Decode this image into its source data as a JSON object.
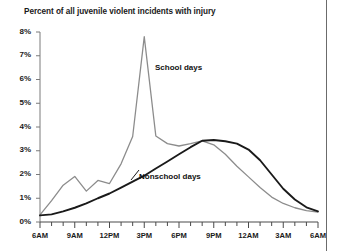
{
  "chart_data": {
    "type": "line",
    "title": "Percent of all juvenile violent incidents with injury",
    "xlabel": "",
    "ylabel": "",
    "grid": false,
    "legend_position": "inline-annotation",
    "ylim": [
      0,
      8
    ],
    "yticks": [
      0,
      1,
      2,
      3,
      4,
      5,
      6,
      7,
      8
    ],
    "ytick_labels": [
      "0%",
      "1%",
      "2%",
      "3%",
      "4%",
      "5%",
      "6%",
      "7%",
      "8%"
    ],
    "x": [
      "6AM",
      "7AM",
      "8AM",
      "9AM",
      "10AM",
      "11AM",
      "12PM",
      "1PM",
      "2PM",
      "3PM",
      "4PM",
      "5PM",
      "6PM",
      "7PM",
      "8PM",
      "9PM",
      "10PM",
      "11PM",
      "12AM",
      "1AM",
      "2AM",
      "3AM",
      "4AM",
      "5AM",
      "6AM"
    ],
    "xtick_labels": [
      "6AM",
      "9AM",
      "12PM",
      "3PM",
      "6PM",
      "9PM",
      "12AM",
      "3AM",
      "6AM"
    ],
    "xtick_label_positions": [
      0,
      3,
      6,
      9,
      12,
      15,
      18,
      21,
      24
    ],
    "series": [
      {
        "name": "School days",
        "color": "#8c8c8c",
        "values": [
          0.3,
          0.9,
          1.55,
          1.92,
          1.3,
          1.75,
          1.62,
          2.45,
          3.6,
          7.8,
          3.62,
          3.3,
          3.2,
          3.3,
          3.42,
          3.25,
          2.85,
          2.35,
          1.9,
          1.45,
          1.05,
          0.78,
          0.6,
          0.48,
          0.42
        ]
      },
      {
        "name": "Nonschool days",
        "color": "#1a1a1a",
        "values": [
          0.28,
          0.32,
          0.45,
          0.6,
          0.78,
          1.0,
          1.2,
          1.45,
          1.7,
          1.95,
          2.25,
          2.55,
          2.85,
          3.15,
          3.42,
          3.45,
          3.4,
          3.3,
          3.05,
          2.6,
          2.0,
          1.4,
          0.95,
          0.62,
          0.45
        ]
      }
    ],
    "annotations": [
      {
        "text": "School days",
        "x": "3PM",
        "y": 6.5
      },
      {
        "text": "Nonschool days",
        "x": "6PM",
        "y": 2.0
      }
    ]
  }
}
